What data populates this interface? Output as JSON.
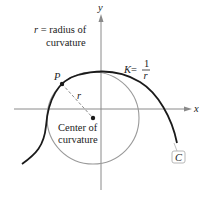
{
  "diagram": {
    "axes": {
      "x_label": "x",
      "y_label": "y"
    },
    "labels": {
      "radius_def_line1_var": "r",
      "radius_def_line1_rest": " = radius of",
      "radius_def_line2": "curvature",
      "point": "P",
      "radius": "r",
      "center_line1": "Center of",
      "center_line2": "curvature",
      "curvature_lhs": "K",
      "curvature_eq": " = ",
      "curvature_num": "1",
      "curvature_den": "r",
      "curve": "C"
    },
    "colors": {
      "curve": "#1a1a1a",
      "circle": "#9a9a9a",
      "axes": "#8a8a8a",
      "radius_line": "#8a8a8a",
      "text": "#222222"
    }
  }
}
